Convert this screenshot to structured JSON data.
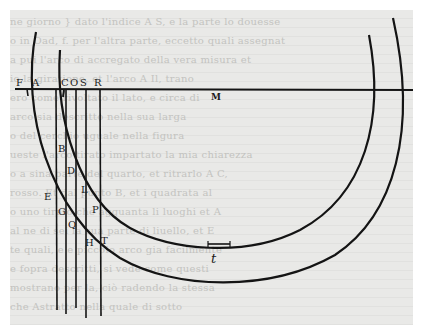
{
  "figure": {
    "labels": {
      "F": "F",
      "A": "A",
      "C": "C",
      "O": "O",
      "S": "S",
      "R": "R",
      "center": "M",
      "B": "B",
      "D": "D",
      "L": "L",
      "E": "E",
      "P": "P",
      "G": "G",
      "Q": "Q",
      "H": "H",
      "T": "T",
      "bottom": "t"
    }
  },
  "bleed_through_text": [
    "ne giorno } dato l'indice A S, e la parte lo douesse",
    "o in Oad, f. per l'altra parte, eccetto quali assegnat",
    "a pui l'arco di accregato della vera misura et",
    "io la giratione, et l'arco A Il, trano",
    "ero come rivoltato il lato, e circa di",
    "arco sia descritto nella sua larga",
    "o del cerchio uguale nella figura",
    "ueste l'arco tirato impartato la mia chiarezza",
    "o a sina parte del quarto, et ritrarlo A C,",
    "rosso. Et dal punto B, et i quadrata al",
    "o uno tirato che agguanta li luoghi et A",
    "al ne di sei la sua parte di liuello, et E",
    "te quali, e e piccolo arco gia facilmente",
    "e fopra descritti, si vede come questi",
    "mostrano per la, ciò radendo la stessa",
    "che Astratto nella quale di sotto"
  ]
}
